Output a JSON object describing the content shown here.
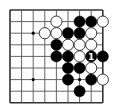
{
  "board": {
    "size": 9,
    "origin": [
      10,
      10
    ],
    "spacing": 11.6,
    "line_color": "#555555",
    "border_color": "#333333",
    "background": "#ffffff",
    "edges": {
      "top": true,
      "bottom": true,
      "left": true,
      "right": true
    },
    "star_points": [
      [
        2,
        2
      ],
      [
        2,
        6
      ],
      [
        6,
        6
      ]
    ]
  },
  "colors": {
    "black_stone": "#000000",
    "white_stone_fill": "#ffffff",
    "white_stone_stroke": "#222222",
    "label_on_black": "#ffffff"
  },
  "stones": [
    {
      "col": 4,
      "row": 1,
      "color": "white"
    },
    {
      "col": 6,
      "row": 1,
      "color": "black"
    },
    {
      "col": 7,
      "row": 1,
      "color": "black"
    },
    {
      "col": 8,
      "row": 1,
      "color": "white"
    },
    {
      "col": 3,
      "row": 2,
      "color": "white"
    },
    {
      "col": 4,
      "row": 2,
      "color": "white"
    },
    {
      "col": 5,
      "row": 2,
      "color": "black"
    },
    {
      "col": 6,
      "row": 2,
      "color": "black"
    },
    {
      "col": 7,
      "row": 2,
      "color": "white"
    },
    {
      "col": 4,
      "row": 3,
      "color": "black"
    },
    {
      "col": 5,
      "row": 3,
      "color": "white"
    },
    {
      "col": 6,
      "row": 3,
      "color": "white"
    },
    {
      "col": 7,
      "row": 3,
      "color": "white"
    },
    {
      "col": 4,
      "row": 4,
      "color": "black"
    },
    {
      "col": 5,
      "row": 4,
      "color": "black"
    },
    {
      "col": 6,
      "row": 4,
      "color": "white"
    },
    {
      "col": 7,
      "row": 4,
      "color": "black",
      "label": "1"
    },
    {
      "col": 8,
      "row": 4,
      "color": "black"
    },
    {
      "col": 5,
      "row": 5,
      "color": "black"
    },
    {
      "col": 6,
      "row": 5,
      "color": "black"
    },
    {
      "col": 7,
      "row": 5,
      "color": "white"
    },
    {
      "col": 5,
      "row": 6,
      "color": "black"
    },
    {
      "col": 7,
      "row": 6,
      "color": "black"
    },
    {
      "col": 8,
      "row": 6,
      "color": "white"
    },
    {
      "col": 6,
      "row": 7,
      "color": "black"
    }
  ]
}
